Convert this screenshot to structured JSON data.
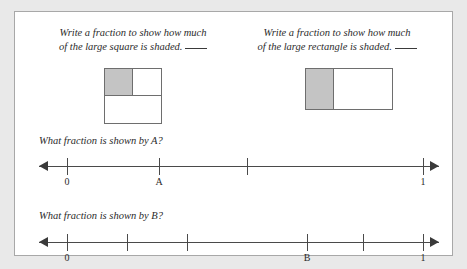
{
  "worksheet": {
    "prompts": [
      {
        "id": "square",
        "line1": "Write a fraction to show how much",
        "line2": "of the large square is shaded.",
        "answer_blank": ""
      },
      {
        "id": "rectangle",
        "line1": "Write a fraction to show how much",
        "line2": "of the large rectangle is shaded.",
        "answer_blank": ""
      }
    ],
    "figures": {
      "square": {
        "name": "large-square",
        "shaded_region": "top-left quadrant",
        "shade_color": "#c4c4c4",
        "outline_color": "#6e6e6e"
      },
      "rectangle": {
        "name": "large-rectangle",
        "shaded_region": "left third",
        "shade_color": "#c4c4c4",
        "outline_color": "#6e6e6e"
      }
    },
    "questions": [
      {
        "id": "a",
        "text": "What fraction is shown by A?"
      },
      {
        "id": "b",
        "text": "What fraction is shown by B?"
      }
    ],
    "number_lines": [
      {
        "id": "a",
        "intervals": 3,
        "ticks": [
          {
            "pos_pct": 7,
            "label": "0"
          },
          {
            "pos_pct": 30,
            "label": "A"
          },
          {
            "pos_pct": 52,
            "label": ""
          },
          {
            "pos_pct": 96,
            "label": "1"
          }
        ]
      },
      {
        "id": "b",
        "intervals": 6,
        "ticks": [
          {
            "pos_pct": 7,
            "label": "0"
          },
          {
            "pos_pct": 22,
            "label": ""
          },
          {
            "pos_pct": 37,
            "label": ""
          },
          {
            "pos_pct": 67,
            "label": "B"
          },
          {
            "pos_pct": 81,
            "label": ""
          },
          {
            "pos_pct": 96,
            "label": "1"
          }
        ]
      }
    ]
  }
}
